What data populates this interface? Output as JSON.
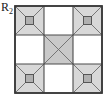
{
  "figure": {
    "label_main": "R",
    "label_sub": "2",
    "caption_full": "R2"
  },
  "colors": {
    "stroke_outer": "#3a3a3a",
    "stroke_grid": "#4a4a4a",
    "stroke_diagonal": "#6b6b6b",
    "fill_triangle": "#d8d8d8",
    "fill_center_cell": "#c9c9c9",
    "fill_small_square": "#b0b0b0",
    "fill_empty": "#ffffff",
    "background": "#ffffff",
    "text": "#1a1a1a"
  },
  "chart_data": {
    "type": "diagram",
    "title": "R2",
    "outer_square": {
      "x": 15,
      "y": 6,
      "width": 87,
      "height": 87
    },
    "grid": {
      "rows": 3,
      "cols": 3,
      "cell_width": 29,
      "cell_height": 29,
      "vertical_lines_x": [
        15,
        44,
        73,
        102
      ],
      "horizontal_lines_y": [
        6,
        35,
        64,
        93
      ]
    },
    "cells": [
      {
        "row": 0,
        "col": 0,
        "name": "top-left",
        "pattern": "x-diagonals-with-center-square",
        "shaded": true,
        "has_center_square": true
      },
      {
        "row": 0,
        "col": 1,
        "name": "top-center",
        "pattern": "empty",
        "shaded": false,
        "has_center_square": false
      },
      {
        "row": 0,
        "col": 2,
        "name": "top-right",
        "pattern": "x-diagonals-with-center-square",
        "shaded": true,
        "has_center_square": true
      },
      {
        "row": 1,
        "col": 0,
        "name": "middle-left",
        "pattern": "empty",
        "shaded": false,
        "has_center_square": false
      },
      {
        "row": 1,
        "col": 1,
        "name": "middle-center",
        "pattern": "x-diagonals-shaded",
        "shaded": true,
        "has_center_square": false
      },
      {
        "row": 1,
        "col": 2,
        "name": "middle-right",
        "pattern": "empty",
        "shaded": false,
        "has_center_square": false
      },
      {
        "row": 2,
        "col": 0,
        "name": "bottom-left",
        "pattern": "x-diagonals-with-center-square",
        "shaded": true,
        "has_center_square": true
      },
      {
        "row": 2,
        "col": 1,
        "name": "bottom-center",
        "pattern": "empty",
        "shaded": false,
        "has_center_square": false
      },
      {
        "row": 2,
        "col": 2,
        "name": "bottom-right",
        "pattern": "x-diagonals-with-center-square",
        "shaded": true,
        "has_center_square": true
      }
    ],
    "small_square_size": 8,
    "legend": [],
    "grid_on": true
  }
}
